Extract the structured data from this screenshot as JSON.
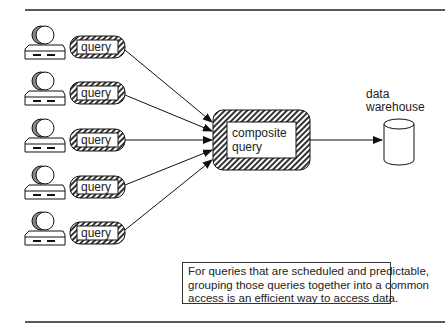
{
  "queries": [
    {
      "label": "query"
    },
    {
      "label": "query"
    },
    {
      "label": "query"
    },
    {
      "label": "query"
    },
    {
      "label": "query"
    }
  ],
  "composite": {
    "line1": "composite",
    "line2": "query"
  },
  "warehouse": {
    "line1": "data",
    "line2": "warehouse"
  },
  "caption": {
    "line1": "For queries that are scheduled and predictable,",
    "line2": "grouping those queries together into a common",
    "line3": "access is an efficient way to access data."
  }
}
